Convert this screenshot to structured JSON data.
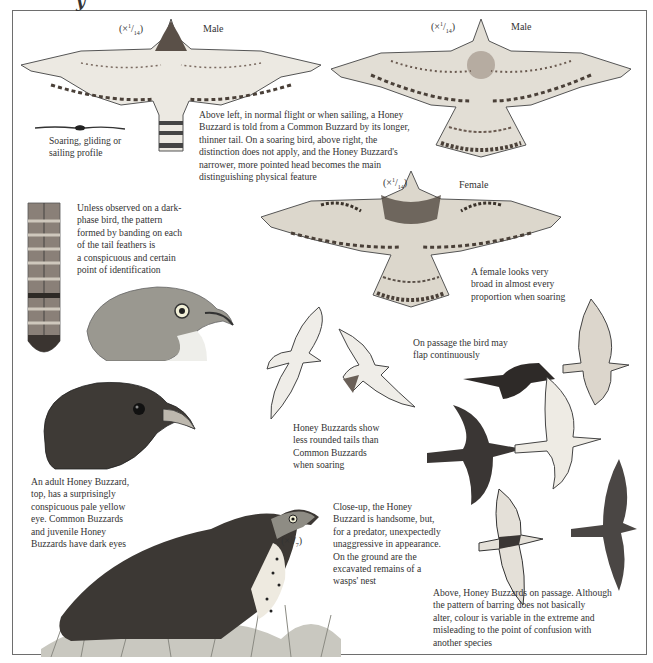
{
  "page": {
    "heading_fragment": "y"
  },
  "figures": {
    "male_underside": {
      "scale": "(×",
      "scale_num": "1",
      "scale_den": "14",
      "scale_close": ")",
      "label": "Male"
    },
    "male_soaring": {
      "scale": "(×",
      "scale_num": "1",
      "scale_den": "14",
      "scale_close": ")",
      "label": "Male"
    },
    "female": {
      "scale": "(×",
      "scale_num": "1",
      "scale_den": "14",
      "scale_close": ")",
      "label": "Female"
    },
    "perched": {
      "scale": "(×",
      "scale_num": "1",
      "scale_den": "7",
      "scale_close": ")"
    }
  },
  "captions": {
    "profile": "Soaring, gliding or\nsailing profile",
    "male_comparison": "Above left, in normal flight or when sailing, a Honey\nBuzzard is told from a Common Buzzard by its longer,\nthinner tail. On a soaring bird, above right, the\ndistinction does not apply, and the Honey Buzzard's\nnarrower, more pointed head becomes the main\ndistinguishing physical feature",
    "tail_feather": "Unless observed on a dark-\nphase bird, the pattern\nformed by banding on each\nof the tail feathers is\na conspicuous and certain\npoint of identification",
    "female_broad": "A female looks very\nbroad in almost every\nproportion when soaring",
    "flap": "On passage the bird may\nflap continuously",
    "tails": "Honey Buzzards show\nless rounded tails than\nCommon Buzzards\nwhen soaring",
    "heads": "An adult Honey Buzzard,\ntop, has a surprisingly\nconspicuous pale yellow\neye. Common Buzzards\nand juvenile Honey\nBuzzards have dark eyes",
    "closeup": "Close-up, the Honey\nBuzzard is handsome, but,\nfor a predator, unexpectedly\nunaggressive in appearance.\nOn the ground are the\nexcavated remains of a\nwasps' nest",
    "passage": "Above, Honey Buzzards on passage. Although\nthe pattern of barring does not basically\nalter, colour is variable in the extreme and\nmisleading to the point of confusion with\nanother species"
  },
  "colors": {
    "frame": "#6e6e6e",
    "ink": "#333333",
    "dark_bird": "#3a3a3a",
    "pale_bird": "#d9d6cf",
    "barring": "#5a5048",
    "head_grey": "#8a8a80",
    "grass": "#9a9a92"
  }
}
